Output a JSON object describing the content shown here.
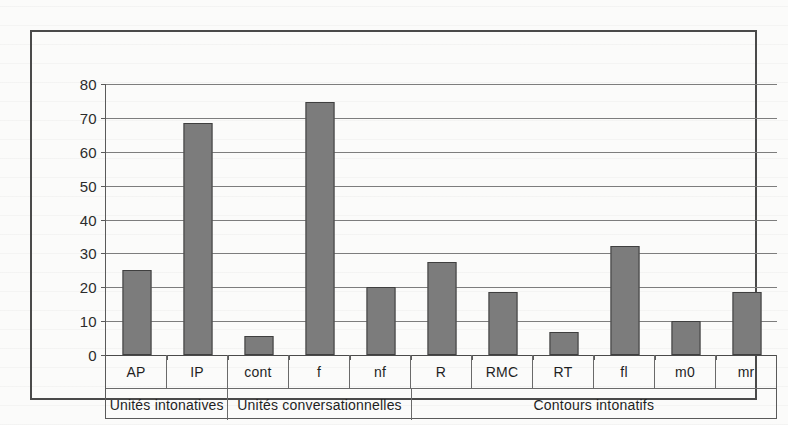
{
  "chart_data": {
    "type": "bar",
    "title": "",
    "xlabel": "",
    "ylabel": "",
    "ylim": [
      0,
      80
    ],
    "yticks": [
      0,
      10,
      20,
      30,
      40,
      50,
      60,
      70,
      80
    ],
    "ytick_labels": [
      "0",
      "10",
      "20",
      "30",
      "40",
      "50",
      "60",
      "70",
      "80"
    ],
    "grid": true,
    "legend": "none",
    "bar_color": "#7c7c7c",
    "bar_edge_color": "#3f3f3f",
    "categories": [
      "AP",
      "IP",
      "cont",
      "f",
      "nf",
      "R",
      "RMC",
      "RT",
      "fl",
      "m0",
      "mr"
    ],
    "values": [
      25,
      68.5,
      5.5,
      74.8,
      20,
      27.6,
      18.6,
      6.7,
      32.2,
      10,
      18.6
    ],
    "groups": [
      {
        "label": "Unités intonatives",
        "span": 2
      },
      {
        "label": "Unités conversationnelles",
        "span": 3
      },
      {
        "label": "Contours intonatifs",
        "span": 6
      }
    ]
  }
}
